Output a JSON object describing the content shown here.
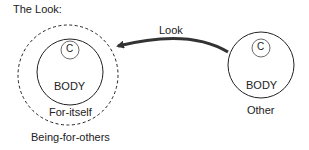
{
  "title": "The Look:",
  "arrow": {
    "label": "Look",
    "direction": "from Other to Being-for-others"
  },
  "left": {
    "consciousness": "C",
    "body": "BODY",
    "inner_label": "For-itself",
    "outer_label": "Being-for-others"
  },
  "right": {
    "consciousness": "C",
    "body": "BODY",
    "label": "Other"
  },
  "colors": {
    "stroke": "#222222",
    "arrow": "#333333",
    "background": "#ffffff"
  }
}
